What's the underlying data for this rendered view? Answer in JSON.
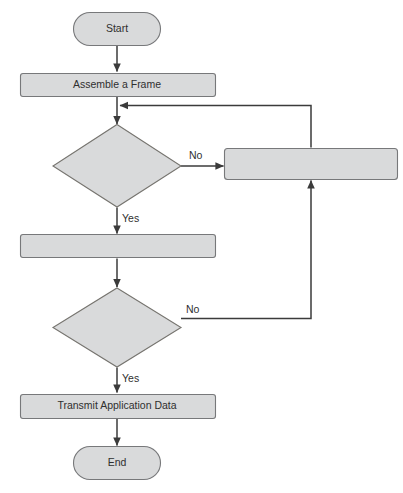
{
  "diagram": {
    "type": "flowchart",
    "background_color": "#ffffff",
    "shape_fill_color": "#d9dadb",
    "shape_border_color": "#77787a",
    "connector_color": "#3b3b3b",
    "text_color": "#2f2f2f",
    "nodes": [
      {
        "id": "start",
        "shape": "terminator",
        "label": "Start"
      },
      {
        "id": "assemble",
        "shape": "process",
        "label": "Assemble a Frame"
      },
      {
        "id": "decision1",
        "shape": "decision",
        "label": ""
      },
      {
        "id": "process_right",
        "shape": "process",
        "label": ""
      },
      {
        "id": "process_mid",
        "shape": "process",
        "label": ""
      },
      {
        "id": "decision2",
        "shape": "decision",
        "label": ""
      },
      {
        "id": "transmit",
        "shape": "process",
        "label": "Transmit Application Data"
      },
      {
        "id": "end",
        "shape": "terminator",
        "label": "End"
      }
    ],
    "edges": [
      {
        "from": "start",
        "to": "assemble",
        "label": ""
      },
      {
        "from": "assemble",
        "to": "decision1",
        "label": ""
      },
      {
        "from": "decision1",
        "to": "process_right",
        "label": "No"
      },
      {
        "from": "decision1",
        "to": "process_mid",
        "label": "Yes"
      },
      {
        "from": "process_right",
        "to": "decision1",
        "label": ""
      },
      {
        "from": "process_mid",
        "to": "decision2",
        "label": ""
      },
      {
        "from": "decision2",
        "to": "process_right",
        "label": "No"
      },
      {
        "from": "decision2",
        "to": "transmit",
        "label": "Yes"
      },
      {
        "from": "transmit",
        "to": "end",
        "label": ""
      }
    ],
    "edge_labels": {
      "decision1_no": "No",
      "decision1_yes": "Yes",
      "decision2_no": "No",
      "decision2_yes": "Yes"
    }
  }
}
